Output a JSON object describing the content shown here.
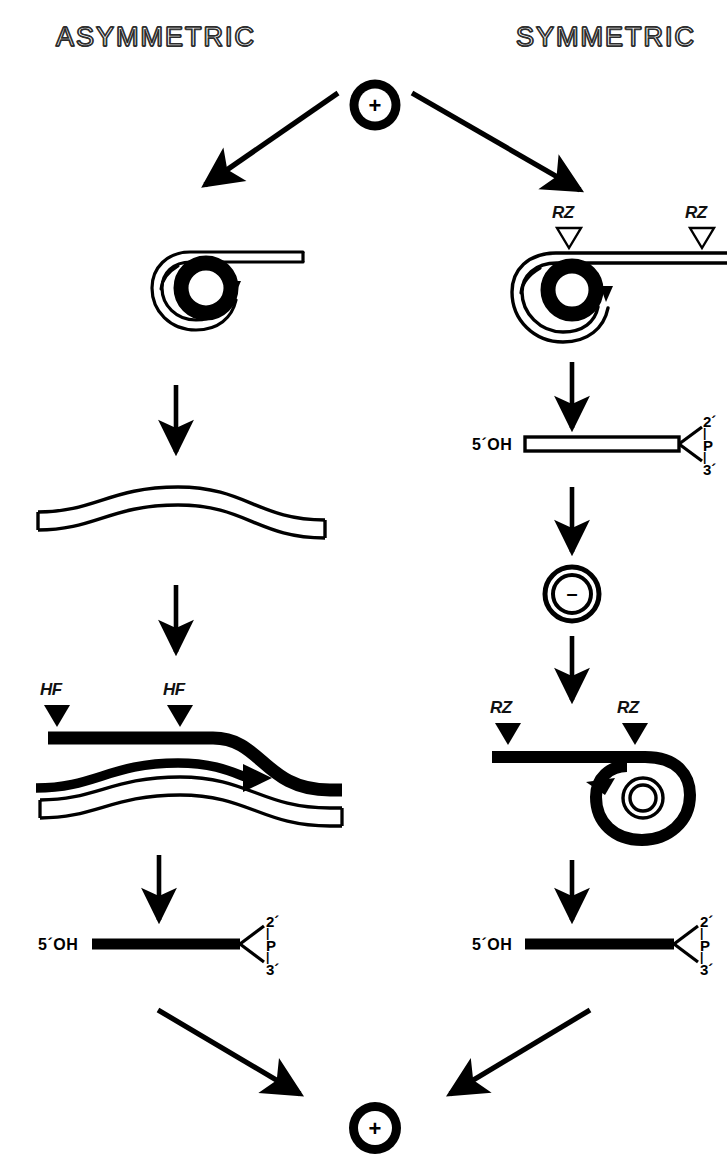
{
  "figure": {
    "type": "pathway-diagram",
    "background_color": "#ffffff",
    "ink_color": "#000000"
  },
  "headings": {
    "left": "ASYMMETRIC",
    "right": "SYMMETRIC"
  },
  "nodes": {
    "start_circle": {
      "sign": "+",
      "style": "filled-ring"
    },
    "end_circle": {
      "sign": "+",
      "style": "filled-ring"
    },
    "minus_circle": {
      "sign": "–",
      "style": "double-outline-ring"
    }
  },
  "left_branch": {
    "stage_1": {
      "name": "rolling-circle-plus-strand",
      "note": "outlined ribbon coil with tail"
    },
    "stage_2": {
      "name": "linear-wavy-outlined-strand"
    },
    "stage_3": {
      "name": "hf-cleavage-complex",
      "tick_labels": [
        "HF",
        "HF"
      ],
      "marker_style": "filled-triangle"
    },
    "stage_4": {
      "name": "terminated-monomer",
      "five_prime": "5´OH",
      "phosphate": {
        "two_prime": "2´",
        "p": "P",
        "three_prime": "3´"
      },
      "bar_style": "solid"
    }
  },
  "right_branch": {
    "stage_1": {
      "name": "rolling-circle-plus-strand",
      "tick_labels": [
        "RZ",
        "RZ"
      ],
      "marker_style": "open-triangle"
    },
    "stage_2": {
      "name": "terminated-monomer",
      "five_prime": "5´OH",
      "phosphate": {
        "two_prime": "2´",
        "p": "P",
        "three_prime": "3´"
      },
      "bar_style": "outlined"
    },
    "stage_3": {
      "name": "minus-circle",
      "sign": "–"
    },
    "stage_4": {
      "name": "rolling-circle-minus-strand",
      "tick_labels": [
        "RZ",
        "RZ"
      ],
      "marker_style": "filled-triangle"
    },
    "stage_5": {
      "name": "terminated-monomer",
      "five_prime": "5´OH",
      "phosphate": {
        "two_prime": "2´",
        "p": "P",
        "three_prime": "3´"
      },
      "bar_style": "solid"
    }
  },
  "arrows": {
    "branch_left": "diagonal-down-left",
    "branch_right": "diagonal-down-right",
    "converge_left": "diagonal-down-right",
    "converge_right": "diagonal-down-left",
    "vertical_count": 6
  }
}
